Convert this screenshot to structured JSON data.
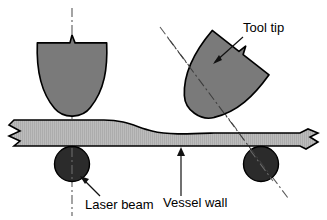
{
  "figure": {
    "type": "technical-cross-section-diagram",
    "width": 327,
    "height": 220,
    "background_color": "#ffffff"
  },
  "colors": {
    "tool_fill": "#7a7a7a",
    "vessel_wall_fill": "#b9b9b9",
    "vessel_wall_hatch": "#a6a6a6",
    "laser_spot_fill": "#2b2b2b",
    "outline": "#000000",
    "centerline": "#555555",
    "leader_line": "#1a1a1a",
    "label_text": "#000000"
  },
  "labels": [
    {
      "id": "tool-tip",
      "text": "Tool tip",
      "x": 243,
      "y": 32,
      "anchor": "start",
      "leader_from": [
        241,
        36
      ],
      "leader_to": [
        213,
        62
      ]
    },
    {
      "id": "laser-beam",
      "text": "Laser beam",
      "x": 85,
      "y": 208,
      "anchor": "start",
      "leader_from": [
        99,
        196
      ],
      "leader_to": [
        80,
        177
      ]
    },
    {
      "id": "vessel-wall",
      "text": "Vessel wall",
      "x": 163,
      "y": 208,
      "anchor": "start",
      "leader_from": [
        181,
        196
      ],
      "leader_to": [
        181,
        148
      ]
    }
  ],
  "parts": {
    "tool_left": {
      "name": "Tool tip (vertical orientation)",
      "notch_tip_x": 72,
      "top_y": 42,
      "bottom_y": 122,
      "left_x": 38,
      "right_x": 106,
      "rotation_deg": 0
    },
    "tool_right": {
      "name": "Tool tip (tilted orientation)",
      "rotation_deg": 38,
      "pivot_x": 208,
      "pivot_y": 130,
      "top_y": 38,
      "bottom_y": 134
    },
    "vessel_wall": {
      "name": "Vessel wall",
      "left_x": 8,
      "right_x": 319,
      "top_y_left": 120,
      "top_y_right": 133,
      "bottom_y": 150,
      "break_marks": [
        "left-zigzag",
        "right-zigzag"
      ],
      "hatch": "fine-vertical"
    },
    "laser_spot_left": {
      "name": "Laser beam spot (left)",
      "cx": 72,
      "cy": 164,
      "r": 17
    },
    "laser_spot_right": {
      "name": "Laser beam spot (right)",
      "cx": 261,
      "cy": 164,
      "r": 17
    }
  },
  "centerlines": [
    {
      "id": "vertical-axis",
      "style": "dash-dot",
      "x1": 72,
      "y1": 8,
      "x2": 72,
      "y2": 216
    },
    {
      "id": "tilted-axis",
      "style": "dash-dot",
      "x1": 160,
      "y1": 27,
      "x2": 288,
      "y2": 198
    }
  ]
}
